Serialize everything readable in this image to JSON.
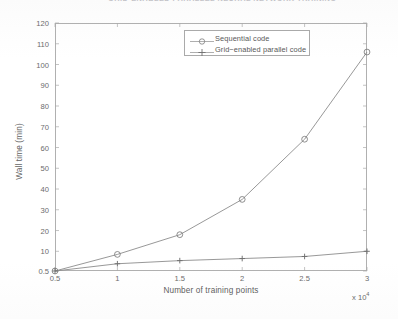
{
  "caption": {
    "text": "GRID-ENABLED PARALLEL NEURAL NETWORK TRAINING",
    "note": "clipped-top-edge"
  },
  "chart_data": {
    "type": "line",
    "title": "",
    "xlabel": "Number of training points",
    "ylabel": "Wall time (min)",
    "x_exponent_label": "x 10",
    "x_exponent_power": "4",
    "x": [
      0.5,
      1,
      1.5,
      2,
      2.5,
      3
    ],
    "xtick_labels": [
      "0.5",
      "1",
      "1.5",
      "2",
      "2.5",
      "3"
    ],
    "ytick_labels": [
      "0.5",
      "10",
      "20",
      "30",
      "40",
      "50",
      "60",
      "70",
      "80",
      "90",
      "100",
      "110",
      "120"
    ],
    "ytick_values": [
      0.5,
      10,
      20,
      30,
      40,
      50,
      60,
      70,
      80,
      90,
      100,
      110,
      120
    ],
    "xlim": [
      0.5,
      3
    ],
    "ylim": [
      0.5,
      120
    ],
    "grid": false,
    "legend_position": "top-center",
    "series": [
      {
        "name": "Sequential code",
        "marker": "circle",
        "color": "#8c8c8c",
        "values": [
          0.5,
          8.5,
          18,
          35,
          64,
          106
        ]
      },
      {
        "name": "Grid−enabled parallel code",
        "marker": "plus",
        "color": "#8c8c8c",
        "values": [
          0.5,
          4,
          5.5,
          6.5,
          7.5,
          10
        ]
      }
    ]
  },
  "legend": {
    "items": [
      {
        "label": "Sequential code",
        "marker": "circle"
      },
      {
        "label": "Grid−enabled parallel code",
        "marker": "plus"
      }
    ]
  }
}
